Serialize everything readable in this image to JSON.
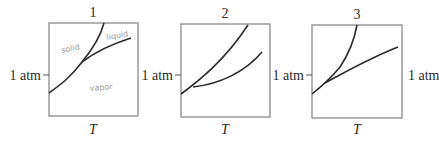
{
  "figure": {
    "colors": {
      "frame": "#8a8a8a",
      "curve": "#2b2b2b",
      "text": "#2a2a2a",
      "handwriting": "#9a9a9a"
    },
    "x_axis_label": "T",
    "pressure_label": "1 atm",
    "right_pressure_label": "1 atm",
    "panels": [
      {
        "id": "1",
        "title": "1",
        "box": {
          "x": 49,
          "y": 23,
          "w": 89,
          "h": 93
        },
        "tick_y": 75,
        "xlabel": "T",
        "ylabel": "1 atm",
        "region_labels": [
          {
            "text": "solid",
            "x": 62,
            "y": 52,
            "rotate": -12
          },
          {
            "text": "liquid",
            "x": 107,
            "y": 40,
            "rotate": -10
          },
          {
            "text": "vapor",
            "x": 90,
            "y": 90,
            "rotate": -5
          }
        ],
        "curves": [
          {
            "name": "sublimation-and-melting-curve",
            "d": "M49,93 C60,85 70,78 82,62 C92,50 100,38 104,23"
          },
          {
            "name": "vaporization-curve",
            "d": "M82,62 C95,52 112,44 131,38"
          }
        ]
      },
      {
        "id": "2",
        "title": "2",
        "box": {
          "x": 181,
          "y": 24,
          "w": 89,
          "h": 93
        },
        "tick_y": 75,
        "xlabel": "T",
        "ylabel": "1 atm",
        "region_labels": [],
        "curves": [
          {
            "name": "upper-coexistence-curve",
            "d": "M181,94 C200,80 225,60 248,25"
          },
          {
            "name": "lower-coexistence-curve",
            "d": "M193,87 C220,84 245,72 262,52"
          }
        ]
      },
      {
        "id": "3",
        "title": "3",
        "box": {
          "x": 312,
          "y": 25,
          "w": 90,
          "h": 93
        },
        "tick_y": 75,
        "xlabel": "T",
        "ylabel": "1 atm",
        "region_labels": [],
        "curves": [
          {
            "name": "steep-coexistence-curve",
            "d": "M312,94 C322,86 332,77 340,67 C348,55 354,42 357,25"
          },
          {
            "name": "shallow-coexistence-curve",
            "d": "M325,83 C345,72 370,58 398,47"
          }
        ]
      }
    ]
  }
}
